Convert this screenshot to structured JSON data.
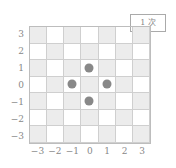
{
  "badge": {
    "label": "1 次"
  },
  "grid": {
    "x_labels": [
      "-3",
      "-2",
      "-1",
      "0",
      "1",
      "2",
      "3"
    ],
    "y_labels": [
      "3",
      "2",
      "1",
      "0",
      "-1",
      "-2",
      "-3"
    ],
    "x_range": [
      -3,
      3
    ],
    "y_range": [
      -3,
      3
    ],
    "pattern": "checkerboard",
    "shade_color": "#ececec",
    "line_color": "#cfcfcf"
  },
  "points": [
    {
      "x": 0,
      "y": 1
    },
    {
      "x": -1,
      "y": 0
    },
    {
      "x": 1,
      "y": 0
    },
    {
      "x": 0,
      "y": -1
    }
  ],
  "point_color": "#888888"
}
